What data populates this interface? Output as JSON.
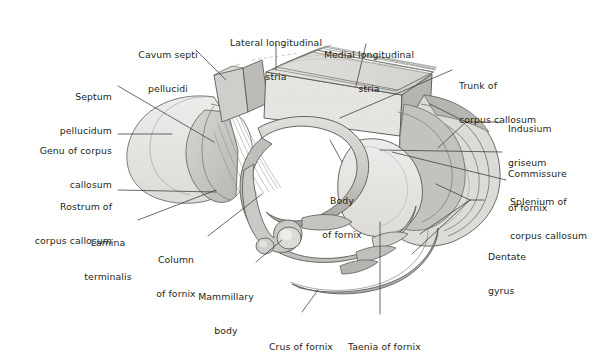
{
  "figure": {
    "background": "#ffffff",
    "ink": "#231f20",
    "palette": {
      "pale_fill": "#e3e2de",
      "mid_fill": "#cfcecb",
      "dark_fill": "#a9a8a5",
      "shadow": "#8e8d8a",
      "stroke": "#5a5957",
      "light_stroke": "#8f8e8c",
      "dashed": "#b9b8b6"
    }
  },
  "labels": [
    {
      "id": "cavum-septi-pellucidi",
      "lines": [
        "Cavum septi",
        "pellucidi"
      ],
      "align": "center"
    },
    {
      "id": "lateral-longitudinal-stria",
      "lines": [
        "Lateral longitudinal",
        "stria"
      ],
      "align": "center"
    },
    {
      "id": "medial-longitudinal-stria",
      "lines": [
        "Medial longitudinal",
        "stria"
      ],
      "align": "center"
    },
    {
      "id": "trunk-of-corpus-callosum",
      "lines": [
        "Trunk of",
        "corpus callosum"
      ],
      "align": "left"
    },
    {
      "id": "indusium-griseum",
      "lines": [
        "Indusium",
        "griseum"
      ],
      "align": "left"
    },
    {
      "id": "commissure-of-fornix",
      "lines": [
        "Commissure",
        "of fornix"
      ],
      "align": "left"
    },
    {
      "id": "splenium-of-corpus-callosum",
      "lines": [
        "Splenium of",
        "corpus callosum"
      ],
      "align": "left"
    },
    {
      "id": "dentate-gyrus",
      "lines": [
        "Dentate",
        "gyrus"
      ],
      "align": "left"
    },
    {
      "id": "taenia-of-fornix",
      "lines": [
        "Taenia of fornix"
      ],
      "align": "left"
    },
    {
      "id": "crus-of-fornix",
      "lines": [
        "Crus of fornix"
      ],
      "align": "center"
    },
    {
      "id": "mammillary-body",
      "lines": [
        "Mammillary",
        "body"
      ],
      "align": "center"
    },
    {
      "id": "column-of-fornix",
      "lines": [
        "Column",
        "of fornix"
      ],
      "align": "center"
    },
    {
      "id": "lamina-terminalis",
      "lines": [
        "Lamina",
        "terminalis"
      ],
      "align": "center"
    },
    {
      "id": "rostrum-of-corpus-callosum",
      "lines": [
        "Rostrum of",
        "corpus callosum"
      ],
      "align": "right"
    },
    {
      "id": "genu-of-corpus-callosum",
      "lines": [
        "Genu of corpus",
        "callosum"
      ],
      "align": "right"
    },
    {
      "id": "septum-pellucidum",
      "lines": [
        "Septum",
        "pellucidum"
      ],
      "align": "right"
    },
    {
      "id": "body-of-fornix",
      "lines": [
        "Body",
        "of fornix"
      ],
      "align": "center"
    }
  ]
}
